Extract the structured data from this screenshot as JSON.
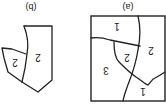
{
  "figure": {
    "orientation": "rotated 180 degrees",
    "panels": [
      {
        "id": "a",
        "caption": "(a)",
        "regions": [
          {
            "label": "1"
          },
          {
            "label": "2"
          },
          {
            "label": "2"
          },
          {
            "label": "3"
          },
          {
            "label": "1"
          }
        ]
      },
      {
        "id": "b",
        "caption": "(b)",
        "regions": [
          {
            "label": "2"
          },
          {
            "label": "2"
          }
        ]
      }
    ],
    "colors": {
      "stroke": "#222222",
      "background": "#ffffff"
    }
  }
}
